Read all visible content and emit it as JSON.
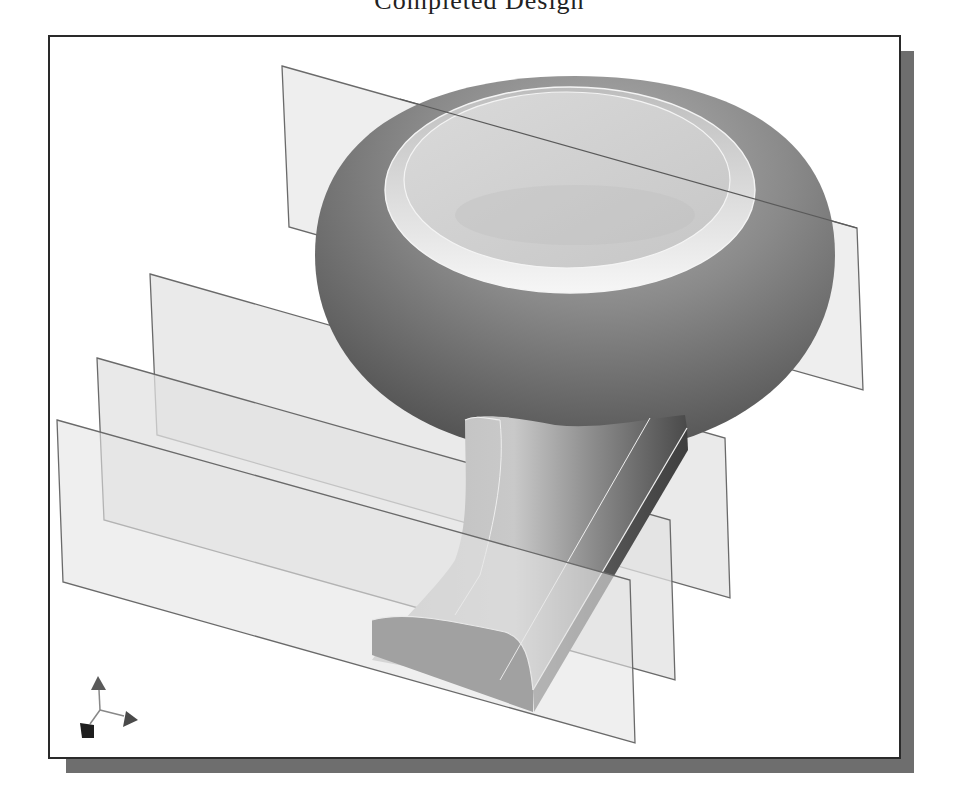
{
  "caption": {
    "text": "Completed Design",
    "note": "only descenders visible at top edge"
  },
  "viewport": {
    "background": "#ffffff",
    "border_color": "#2a2a2a",
    "shadow_color": "#6e6e6e"
  },
  "model": {
    "name": "frying-pan-model",
    "parts": [
      "bowl",
      "handle"
    ],
    "colors": {
      "bowl_dark": "#5a5a5a",
      "bowl_mid": "#8a8a8a",
      "bowl_top": "#d4d4d4",
      "rim_highlight": "#f4f4f4",
      "handle_light": "#c8c8c8",
      "handle_dark": "#555555",
      "handle_end": "#3c3c3c",
      "plane_fill": "#e6e6e6",
      "plane_edge": "#6a6a6a"
    }
  },
  "datum_planes": [
    {
      "name": "datum-plane-top"
    },
    {
      "name": "datum-plane-a"
    },
    {
      "name": "datum-plane-b"
    },
    {
      "name": "datum-plane-c"
    }
  ],
  "axis_triad": {
    "axes": [
      "y-axis",
      "x-axis",
      "z-axis"
    ]
  }
}
